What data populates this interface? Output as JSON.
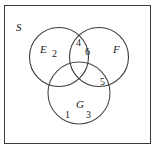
{
  "figure": {
    "type": "venn-diagram-3-set",
    "background_color": "#ffffff",
    "stroke_color": "#3a3a3a",
    "text_color": "#1a1a1a"
  },
  "universal_set": {
    "label": "S",
    "shape": "rectangle"
  },
  "sets": [
    {
      "id": "E",
      "label": "E",
      "position": "upper-left"
    },
    {
      "id": "F",
      "label": "F",
      "position": "upper-right"
    },
    {
      "id": "G",
      "label": "G",
      "position": "bottom-center"
    }
  ],
  "region_counts": [
    {
      "region": "E-only",
      "value": "2"
    },
    {
      "region": "E-and-F-only-upper",
      "value": "4"
    },
    {
      "region": "E-and-F-only-lower",
      "value": "6"
    },
    {
      "region": "F-and-G-only",
      "value": "5"
    },
    {
      "region": "G-only-left",
      "value": "1"
    },
    {
      "region": "G-only-right",
      "value": "3"
    }
  ]
}
